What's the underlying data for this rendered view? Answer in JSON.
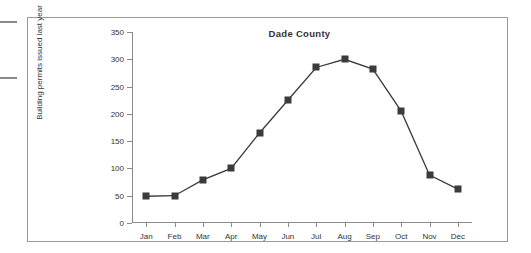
{
  "chart_data": {
    "type": "line",
    "title": "Dade County",
    "xlabel": "",
    "ylabel": "Building permits issued last year",
    "categories": [
      "Jan",
      "Feb",
      "Mar",
      "Apr",
      "May",
      "Jun",
      "Jul",
      "Aug",
      "Sep",
      "Oct",
      "Nov",
      "Dec"
    ],
    "values": [
      49,
      50,
      79,
      100,
      165,
      225,
      285,
      300,
      282,
      205,
      88,
      62
    ],
    "ylim": [
      0,
      350
    ],
    "ytick_labels": [
      "0",
      "50",
      "100",
      "150",
      "200",
      "250",
      "300",
      "350"
    ],
    "ytick_values": [
      0,
      50,
      100,
      150,
      200,
      250,
      300,
      350
    ],
    "grid": false,
    "legend": "none",
    "marker": "filled-square",
    "series_color": "#3b3b3b",
    "axis_color": "#8b8b8b",
    "text_color": "#333333",
    "frame_color": "#9a9a9a"
  },
  "figure": {
    "background": "#ffffff",
    "margin_rules": 2
  }
}
